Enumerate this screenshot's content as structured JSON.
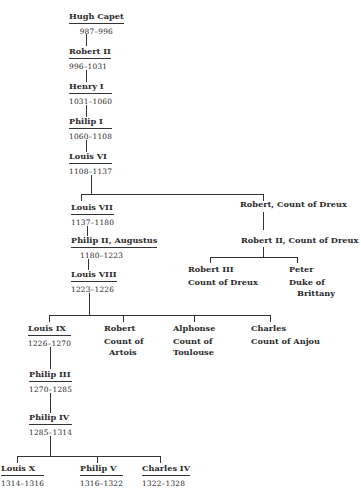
{
  "tree": {
    "hugh_capet": {
      "name": "Hugh Capet",
      "dates": "987–996"
    },
    "robert_ii": {
      "name": "Robert II",
      "dates": "996–1031"
    },
    "henry_i": {
      "name": "Henry I",
      "dates": "1031–1060"
    },
    "philip_i": {
      "name": "Philip I",
      "dates": "1060–1108"
    },
    "louis_vi": {
      "name": "Louis VI",
      "dates": "1108–1137"
    },
    "louis_vii": {
      "name": "Louis VII",
      "dates": "1137–1180"
    },
    "philip_ii": {
      "name": "Philip II, Augustus",
      "dates": "1180–1223"
    },
    "louis_viii": {
      "name": "Louis VIII",
      "dates": "1223–1226"
    },
    "louis_ix": {
      "name": "Louis IX",
      "dates": "1226–1270"
    },
    "philip_iii": {
      "name": "Philip III",
      "dates": "1270–1285"
    },
    "philip_iv": {
      "name": "Philip IV",
      "dates": "1285–1314"
    },
    "louis_x": {
      "name": "Louis X",
      "dates": "1314–1316"
    },
    "philip_v": {
      "name": "Philip V",
      "dates": "1316–1322"
    },
    "charles_iv": {
      "name": "Charles IV",
      "dates": "1322–1328"
    },
    "robert_dreux": {
      "name": "Robert, Count of Dreux"
    },
    "robert_ii_dreux": {
      "name": "Robert II, Count of Dreux"
    },
    "robert_iii_dreux": {
      "name": "Robert III",
      "title": "Count of Dreux"
    },
    "peter": {
      "name": "Peter",
      "title_1": "Duke of",
      "title_2": "Brittany"
    },
    "robert_artois": {
      "name": "Robert",
      "title_1": "Count of",
      "title_2": "Artois"
    },
    "alphonse": {
      "name": "Alphonse",
      "title_1": "Count of",
      "title_2": "Toulouse"
    },
    "charles_anjou": {
      "name": "Charles",
      "title": "Count of Anjou"
    }
  }
}
